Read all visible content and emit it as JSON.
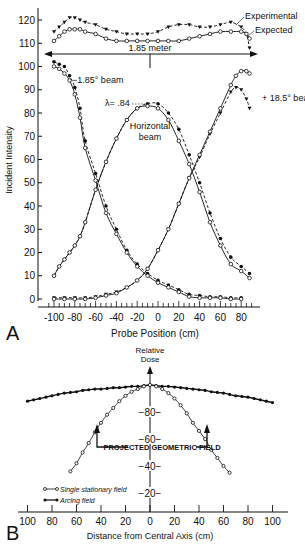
{
  "chart_data": [
    {
      "panel": "A",
      "type": "line",
      "xlabel": "Probe Position (cm)",
      "ylabel": "Incident Intensity",
      "xlim": [
        -105,
        90
      ],
      "ylim": [
        0,
        125
      ],
      "xticks": [
        -100,
        -80,
        -60,
        -40,
        -20,
        0,
        20,
        40,
        60,
        80
      ],
      "yticks": [
        0,
        10,
        20,
        30,
        40,
        50,
        60,
        70,
        80,
        90,
        100,
        110,
        120
      ],
      "grid": false,
      "annotations": {
        "span": "1.85 meter",
        "lambda": "λ= .84",
        "experimental": "Experimental",
        "expected": "Expected",
        "left_beam": "−1.85° beam",
        "right_beam": "+ 18.5° beam",
        "center_beam_1": "Horizontal",
        "center_beam_2": "beam"
      },
      "series": [
        {
          "name": "Sum experimental",
          "style": "dashed",
          "marker": "triangle-filled",
          "x": [
            -100,
            -95,
            -90,
            -85,
            -80,
            -75,
            -70,
            -60,
            -50,
            -40,
            -30,
            -20,
            -10,
            0,
            10,
            20,
            30,
            40,
            50,
            60,
            70,
            80,
            85,
            88
          ],
          "y": [
            115,
            117,
            119,
            121,
            121,
            120,
            119,
            118,
            116,
            115,
            114,
            114,
            114,
            115,
            117,
            118,
            118,
            117,
            117,
            118,
            119,
            117,
            114,
            108
          ]
        },
        {
          "name": "Sum expected",
          "style": "solid",
          "marker": "circle-open",
          "x": [
            -100,
            -95,
            -90,
            -85,
            -80,
            -75,
            -70,
            -60,
            -50,
            -40,
            -30,
            -20,
            -10,
            0,
            10,
            20,
            30,
            40,
            50,
            60,
            70,
            80,
            85,
            88
          ],
          "y": [
            111,
            113,
            115,
            116,
            116,
            116,
            115,
            114,
            112,
            111,
            111,
            111,
            111,
            111,
            111,
            111,
            112,
            113,
            114,
            115,
            115,
            115,
            114,
            112
          ]
        },
        {
          "name": "-1.85° beam experimental",
          "style": "dashed",
          "marker": "circle-filled",
          "x": [
            -100,
            -95,
            -90,
            -85,
            -80,
            -75,
            -70,
            -60,
            -50,
            -40,
            -30,
            -20,
            -10,
            0,
            10,
            20,
            30,
            40,
            50,
            60,
            70,
            80
          ],
          "y": [
            102,
            101,
            100,
            96,
            91,
            82,
            68,
            54,
            40,
            30,
            21,
            15,
            11,
            8,
            6,
            4,
            2,
            1.5,
            1,
            1,
            0.5,
            0.5
          ]
        },
        {
          "name": "-1.85° beam expected",
          "style": "solid",
          "marker": "circle-open",
          "x": [
            -100,
            -95,
            -90,
            -85,
            -80,
            -75,
            -70,
            -60,
            -50,
            -40,
            -30,
            -20,
            -10,
            0,
            10,
            20,
            30,
            40,
            50,
            60,
            70,
            80
          ],
          "y": [
            100,
            99,
            97,
            94,
            88,
            78,
            65,
            51,
            37,
            28,
            20,
            14,
            10,
            7,
            5,
            3,
            1,
            0.5,
            0.5,
            0.5,
            0,
            0
          ]
        },
        {
          "name": "Horizontal beam experimental",
          "style": "dashed",
          "marker": "circle-filled",
          "x": [
            -100,
            -95,
            -90,
            -85,
            -80,
            -75,
            -70,
            -60,
            -50,
            -40,
            -30,
            -20,
            -10,
            0,
            10,
            20,
            30,
            40,
            50,
            60,
            70,
            80,
            88
          ],
          "y": [
            10,
            14,
            17,
            20,
            23,
            27,
            33,
            47,
            59,
            69,
            77,
            82,
            84,
            84,
            80,
            73,
            62,
            50,
            37,
            26,
            18,
            14,
            11
          ]
        },
        {
          "name": "Horizontal beam expected",
          "style": "solid",
          "marker": "circle-open",
          "x": [
            -100,
            -95,
            -90,
            -85,
            -80,
            -75,
            -70,
            -60,
            -50,
            -40,
            -30,
            -20,
            -10,
            0,
            10,
            20,
            30,
            40,
            50,
            60,
            70,
            80,
            88
          ],
          "y": [
            10,
            14,
            17,
            20,
            23,
            27,
            33,
            47,
            59,
            69,
            77,
            82,
            83,
            82,
            77,
            68,
            58,
            46,
            33,
            23,
            15,
            12,
            9
          ]
        },
        {
          "name": "+18.5° beam experimental",
          "style": "dashed",
          "marker": "triangle-filled",
          "x": [
            -100,
            -90,
            -80,
            -70,
            -60,
            -50,
            -40,
            -30,
            -20,
            -10,
            0,
            10,
            20,
            30,
            40,
            50,
            60,
            70,
            75,
            80,
            85,
            88
          ],
          "y": [
            0.5,
            0.5,
            0.5,
            0.5,
            1,
            2,
            3,
            5,
            8,
            13,
            21,
            30,
            41,
            52,
            61,
            71,
            80,
            89,
            91,
            90,
            86,
            82
          ]
        },
        {
          "name": "+18.5° beam expected",
          "style": "solid",
          "marker": "circle-open",
          "x": [
            -100,
            -90,
            -80,
            -70,
            -60,
            -50,
            -40,
            -30,
            -20,
            -10,
            0,
            10,
            20,
            30,
            40,
            50,
            60,
            70,
            75,
            80,
            85,
            88
          ],
          "y": [
            0,
            0,
            0,
            0,
            0.5,
            1.5,
            2.5,
            5,
            8,
            13,
            21,
            30,
            41,
            52,
            62,
            72,
            82,
            92,
            96,
            98,
            98,
            97
          ]
        }
      ]
    },
    {
      "panel": "B",
      "type": "line",
      "title": "Relative Dose",
      "xlabel": "Distance from Central Axis (cm)",
      "ylabel": "Relative Dose",
      "xlim": [
        -105,
        105
      ],
      "ylim": [
        0,
        105
      ],
      "xtick_labels": [
        "100",
        "80",
        "60",
        "40",
        "20",
        "0",
        "20",
        "40",
        "60",
        "80",
        "100"
      ],
      "xticks": [
        -100,
        -80,
        -60,
        -40,
        -20,
        0,
        20,
        40,
        60,
        80,
        100
      ],
      "yticks": [
        20,
        40,
        60,
        80
      ],
      "grid": false,
      "annotations": {
        "field": "PROJECTED GEOMETRIC FIELD",
        "y_title_1": "Relative",
        "y_title_2": "Dose"
      },
      "legend": [
        {
          "label": "Single stationary field",
          "marker": "circle-open"
        },
        {
          "label": "Arcing field",
          "marker": "circle-filled"
        }
      ],
      "series": [
        {
          "name": "Arcing field",
          "marker": "circle-filled",
          "x": [
            -100,
            -95,
            -90,
            -85,
            -80,
            -75,
            -70,
            -65,
            -60,
            -55,
            -50,
            -45,
            -40,
            -35,
            -30,
            -25,
            -20,
            -15,
            -10,
            -5,
            0,
            5,
            10,
            15,
            20,
            25,
            30,
            35,
            40,
            45,
            50,
            55,
            60,
            65,
            70,
            75,
            80,
            85,
            90,
            95,
            100
          ],
          "y": [
            88,
            89,
            90,
            91,
            92,
            93,
            94,
            94.5,
            95,
            96,
            96.5,
            97,
            97,
            97.5,
            98,
            98,
            98.5,
            99,
            99,
            99.5,
            100,
            99.5,
            99,
            99,
            98.5,
            98,
            97.5,
            97,
            96.5,
            96,
            95,
            94.5,
            94,
            93,
            92,
            91.5,
            91,
            90,
            89,
            88,
            87
          ]
        },
        {
          "name": "Single stationary field",
          "marker": "circle-open",
          "x": [
            -65,
            -60,
            -55,
            -50,
            -45,
            -40,
            -35,
            -30,
            -25,
            -20,
            -15,
            -10,
            -5,
            0,
            5,
            10,
            15,
            20,
            25,
            30,
            35,
            40,
            45,
            50,
            55,
            60,
            65
          ],
          "y": [
            36,
            42,
            50,
            57,
            65,
            72,
            78,
            83,
            88,
            92,
            95,
            97,
            99,
            100,
            99,
            97,
            94,
            90,
            85,
            79,
            72,
            66,
            60,
            52,
            46,
            40,
            35
          ]
        }
      ]
    }
  ],
  "labels": {
    "panel_a": "A",
    "panel_b": "B"
  }
}
